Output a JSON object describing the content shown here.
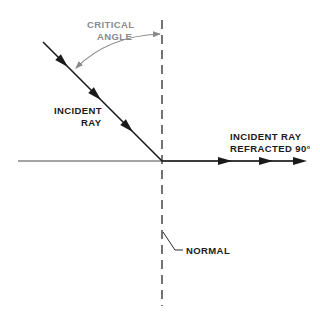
{
  "diagram": {
    "type": "optics-refraction",
    "labels": {
      "critical_angle_line1": "CRITICAL",
      "critical_angle_line2": "ANGLE",
      "incident_ray_line1": "INCIDENT",
      "incident_ray_line2": "RAY",
      "refracted_line1": "INCIDENT RAY",
      "refracted_line2": "REFRACTED 90°",
      "normal": "NORMAL"
    },
    "colors": {
      "ray": "#1a1a1a",
      "interface": "#4a4a4a",
      "normal": "#2a2a2a",
      "critical_angle": "#8a8a8a",
      "text": "#1a1a1a",
      "critical_text": "#8a8a8a"
    },
    "elements": [
      {
        "id": "normal-line",
        "style": "dashed",
        "orientation": "vertical"
      },
      {
        "id": "interface-line",
        "style": "solid",
        "orientation": "horizontal"
      },
      {
        "id": "incident-ray",
        "arrows": 3,
        "direction": "down-right"
      },
      {
        "id": "refracted-ray",
        "arrows": 3,
        "direction": "right"
      },
      {
        "id": "critical-angle-arc",
        "arrows": 2,
        "direction": "both"
      }
    ]
  }
}
